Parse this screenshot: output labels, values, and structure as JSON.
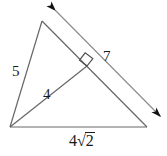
{
  "figure": {
    "type": "geometry-diagram",
    "background_color": "#ffffff",
    "stroke_color": "#555555",
    "label_color": "#1a1a1a",
    "width": 167,
    "height": 156,
    "labels": {
      "left_side": "5",
      "altitude": "4",
      "hypotenuse_dimension": "7",
      "base_coefficient": "4",
      "base_radical_sign": "√",
      "base_radicand": "2",
      "base_full": "4√2"
    },
    "markers": {
      "right_angle": "right-angle-square",
      "dimension_arrow_start": "arrowhead-up-right",
      "dimension_arrow_end": "arrowhead-down-right"
    },
    "vertices": {
      "bottom_left": [
        10,
        127
      ],
      "apex": [
        42,
        21
      ],
      "bottom_right": [
        147,
        127
      ],
      "altitude_foot": [
        87,
        66
      ]
    }
  }
}
